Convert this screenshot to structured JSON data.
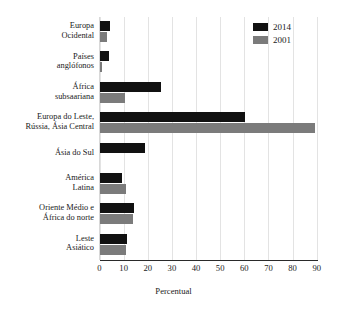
{
  "chart_data": {
    "type": "bar",
    "orientation": "horizontal",
    "title": "",
    "xlabel": "Percentual",
    "ylabel": "",
    "xlim": [
      0,
      90
    ],
    "xticks": [
      0,
      10,
      20,
      30,
      40,
      50,
      60,
      70,
      80,
      90
    ],
    "grid": true,
    "legend_position": "top-right",
    "categories": [
      "Europa Ocidental",
      "Países anglófonos",
      "África subsaariana",
      "Europa do Leste, Rússia, Ásia Central",
      "Ásia do Sul",
      "América Latina",
      "Oriente Médio e África do norte",
      "Leste Asiático"
    ],
    "category_lines": [
      [
        "Europa",
        "Ocidental"
      ],
      [
        "Países",
        "anglófonos"
      ],
      [
        "África",
        "subsaariana"
      ],
      [
        "Europa do Leste,",
        "Rússia, Ásia Central"
      ],
      [
        "Ásia do Sul",
        ""
      ],
      [
        "América",
        "Latina"
      ],
      [
        "Oriente Médio e",
        "África do norte"
      ],
      [
        "Leste",
        "Asiático"
      ]
    ],
    "series": [
      {
        "name": "2014",
        "color": "#111111",
        "values": [
          4.3,
          4.0,
          25.3,
          60.3,
          18.7,
          9.3,
          14.5,
          11.5
        ]
      },
      {
        "name": "2001",
        "color": "#7b7b7b",
        "values": [
          3.0,
          1.2,
          10.5,
          89.5,
          0,
          11.0,
          13.8,
          11.0
        ]
      }
    ]
  },
  "legend": {
    "items": [
      {
        "label": "2014",
        "color": "#111111"
      },
      {
        "label": "2001",
        "color": "#7b7b7b"
      }
    ]
  },
  "axis": {
    "x_title": "Percentual"
  },
  "colors": {
    "series_2014": "#111111",
    "series_2001": "#7b7b7b",
    "grid": "#e3e3e3",
    "axis": "#2a2a2a",
    "background": "#ffffff"
  }
}
